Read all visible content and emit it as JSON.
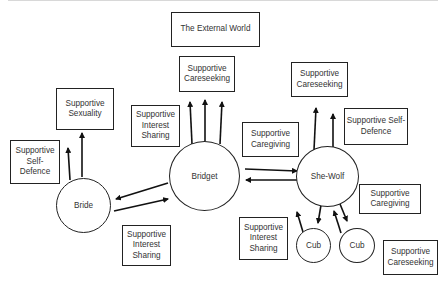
{
  "diagram": {
    "nodes": {
      "bride": "Bride",
      "bridget": "Bridget",
      "she_wolf": "She-Wolf",
      "cub1": "Cub",
      "cub2": "Cub"
    },
    "boxes": {
      "external_world": "The External World",
      "careseeking_top": "Supportive Careseeking",
      "sexuality": "Supportive Sexuality",
      "interest_sharing_upper": "Supportive Interest Sharing",
      "self_defence_left": "Supportive Self-Defence",
      "caregiving_middle": "Supportive Caregiving",
      "careseeking_right": "Supportive Careseeking",
      "self_defence_right": "Supportive Self-Defence",
      "caregiving_right": "Supportive Caregiving",
      "careseeking_bottom_right": "Supportive Careseeking",
      "interest_sharing_bottom_left": "Supportive Interest Sharing",
      "interest_sharing_bottom_middle": "Supportive Interest Sharing"
    },
    "edges": [
      {
        "from": "Bride",
        "to": "Supportive Self-Defence"
      },
      {
        "from": "Bride",
        "to": "Supportive Sexuality"
      },
      {
        "from": "Bridget",
        "to": "Bride"
      },
      {
        "from": "Bride",
        "to": "Bridget"
      },
      {
        "from": "Bridget",
        "to": "Supportive Careseeking (x3)"
      },
      {
        "from": "Bridget",
        "to": "She-Wolf"
      },
      {
        "from": "She-Wolf",
        "to": "Bridget"
      },
      {
        "from": "She-Wolf",
        "to": "Supportive Careseeking (x2)"
      },
      {
        "from": "She-Wolf",
        "to": "Cub"
      },
      {
        "from": "Cub",
        "to": "She-Wolf"
      }
    ]
  }
}
